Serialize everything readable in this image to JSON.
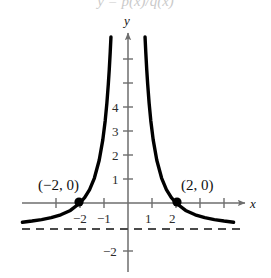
{
  "figure": {
    "width": 271,
    "height": 278,
    "background": "#ffffff",
    "cut_off_title": "y = p(x)/q(x)"
  },
  "axes": {
    "x_axis_label": "x",
    "y_axis_label": "y",
    "origin_px": {
      "x": 128,
      "y": 203
    },
    "unit_px": {
      "x": 24,
      "y": 24
    },
    "x_range": [
      -4.4,
      4.9
    ],
    "y_range": [
      -3.0,
      7.1
    ],
    "x_axis_color": "#6e6e6e",
    "y_axis_color": "#6e6e6e",
    "curve_color": "#000000",
    "asymptote_color": "#4a4a4a"
  },
  "x_ticks": [
    {
      "value": -3,
      "label": "",
      "px": 56
    },
    {
      "value": -2,
      "label": "−2",
      "px": 80
    },
    {
      "value": -1,
      "label": "−1",
      "px": 104
    },
    {
      "value": 1,
      "label": "1",
      "px": 152
    },
    {
      "value": 2,
      "label": "2",
      "px": 176
    },
    {
      "value": 3,
      "label": "",
      "px": 200
    },
    {
      "value": 4,
      "label": "",
      "px": 224
    }
  ],
  "y_ticks": [
    {
      "value": 6,
      "label": "",
      "px": 59
    },
    {
      "value": 5,
      "label": "",
      "px": 83
    },
    {
      "value": 4,
      "label": "4",
      "px": 107
    },
    {
      "value": 3,
      "label": "3",
      "px": 131
    },
    {
      "value": 2,
      "label": "2",
      "px": 155
    },
    {
      "value": 1,
      "label": "1",
      "px": 179
    },
    {
      "value": -2,
      "label": "−2",
      "px": 251
    }
  ],
  "points": [
    {
      "name": "left-intercept",
      "label": "(−2, 0)",
      "x": -2,
      "y": 0,
      "px": {
        "x": 79,
        "y": 202
      },
      "label_px": {
        "x": 38,
        "y": 178
      }
    },
    {
      "name": "right-intercept",
      "label": "(2, 0)",
      "x": 2,
      "y": 0,
      "px": {
        "x": 177,
        "y": 202
      },
      "label_px": {
        "x": 181,
        "y": 178
      }
    }
  ],
  "asymptote": {
    "label": "y = -1",
    "value": -1,
    "style": "dashed",
    "px_y": 229,
    "px_x_start": 22,
    "px_x_end": 241
  },
  "chart_data": {
    "type": "line",
    "title": "",
    "xlabel": "x",
    "ylabel": "y",
    "xlim": [
      -4.4,
      4.9
    ],
    "ylim": [
      -3.0,
      7.1
    ],
    "grid": false,
    "legend": "none",
    "x_ticks": [
      -3,
      -2,
      -1,
      1,
      2,
      3,
      4
    ],
    "x_tick_labels": [
      "",
      "-2",
      "-1",
      "1",
      "2",
      "",
      ""
    ],
    "y_ticks": [
      6,
      5,
      4,
      3,
      2,
      1,
      -2
    ],
    "y_tick_labels": [
      "",
      "",
      "4",
      "3",
      "2",
      "1",
      "-2"
    ],
    "annotations": [
      {
        "text": "(-2, 0)",
        "x": -2,
        "y": 0
      },
      {
        "text": "(2, 0)",
        "x": 2,
        "y": 0
      }
    ],
    "horizontal_asymptote": -1,
    "vertical_asymptotes": [
      0
    ],
    "x_intercepts": [
      -2,
      2
    ],
    "series": [
      {
        "name": "left-branch",
        "points": [
          {
            "x": -4.4,
            "y": -0.8
          },
          {
            "x": -4.0,
            "y": -0.75
          },
          {
            "x": -3.6,
            "y": -0.69
          },
          {
            "x": -3.2,
            "y": -0.61
          },
          {
            "x": -2.8,
            "y": -0.49
          },
          {
            "x": -2.4,
            "y": -0.31
          },
          {
            "x": -2.0,
            "y": 0.0
          },
          {
            "x": -1.8,
            "y": 0.23
          },
          {
            "x": -1.6,
            "y": 0.56
          },
          {
            "x": -1.4,
            "y": 1.04
          },
          {
            "x": -1.2,
            "y": 1.78
          },
          {
            "x": -1.05,
            "y": 2.63
          },
          {
            "x": -0.95,
            "y": 3.43
          },
          {
            "x": -0.88,
            "y": 4.16
          },
          {
            "x": -0.82,
            "y": 4.95
          },
          {
            "x": -0.78,
            "y": 5.57
          },
          {
            "x": -0.74,
            "y": 6.3
          },
          {
            "x": -0.71,
            "y": 6.92
          }
        ]
      },
      {
        "name": "right-branch",
        "points": [
          {
            "x": 0.71,
            "y": 6.92
          },
          {
            "x": 0.74,
            "y": 6.3
          },
          {
            "x": 0.78,
            "y": 5.57
          },
          {
            "x": 0.82,
            "y": 4.95
          },
          {
            "x": 0.88,
            "y": 4.16
          },
          {
            "x": 0.95,
            "y": 3.43
          },
          {
            "x": 1.05,
            "y": 2.63
          },
          {
            "x": 1.2,
            "y": 1.78
          },
          {
            "x": 1.4,
            "y": 1.04
          },
          {
            "x": 1.6,
            "y": 0.56
          },
          {
            "x": 1.8,
            "y": 0.23
          },
          {
            "x": 2.0,
            "y": 0.0
          },
          {
            "x": 2.4,
            "y": -0.31
          },
          {
            "x": 2.8,
            "y": -0.49
          },
          {
            "x": 3.2,
            "y": -0.61
          },
          {
            "x": 3.6,
            "y": -0.69
          },
          {
            "x": 4.0,
            "y": -0.75
          },
          {
            "x": 4.4,
            "y": -0.8
          }
        ]
      }
    ]
  }
}
